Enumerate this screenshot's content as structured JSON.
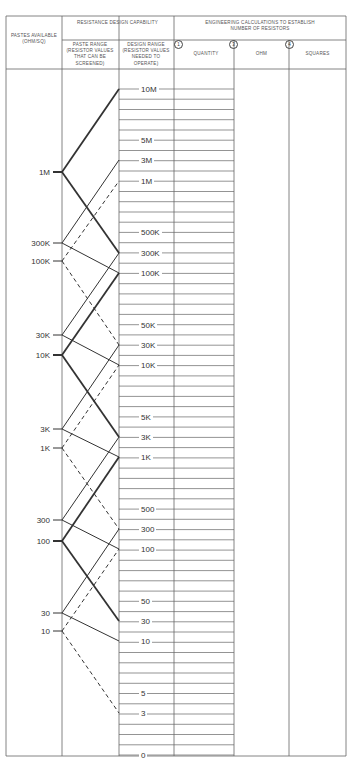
{
  "header": {
    "col_paste_available": "PASTES AVAILABLE (OHM/SQ)",
    "group_resistance": "RESISTANCE DESIGN CAPABILITY",
    "col_paste_range": "PASTE RANGE (RESISTOR VALUES THAT CAN BE SCREENED)",
    "col_design_range": "DESIGN RANGE (RESISTOR VALUES NEEDED TO OPERATE)",
    "group_engineering": "ENGINEERING CALCULATIONS TO ESTABLISH NUMBER OF RESISTORS",
    "col_quantity": {
      "num": "1",
      "label": "QUANTITY"
    },
    "col_ohm": {
      "num": "3",
      "label": "OHM"
    },
    "col_squares": {
      "num": "4",
      "label": "SQUARES"
    }
  },
  "pastes": [
    {
      "label": "1M",
      "y": 172,
      "style": "bold"
    },
    {
      "label": "300K",
      "y": 243,
      "style": "thin"
    },
    {
      "label": "100K",
      "y": 261,
      "style": "dashed"
    },
    {
      "label": "30K",
      "y": 335,
      "style": "thin"
    },
    {
      "label": "10K",
      "y": 355,
      "style": "bold"
    },
    {
      "label": "3K",
      "y": 429,
      "style": "thin"
    },
    {
      "label": "1K",
      "y": 448,
      "style": "dashed"
    },
    {
      "label": "300",
      "y": 520,
      "style": "thin"
    },
    {
      "label": "100",
      "y": 541,
      "style": "bold"
    },
    {
      "label": "30",
      "y": 613,
      "style": "thin"
    },
    {
      "label": "10",
      "y": 631,
      "style": "dashed"
    }
  ],
  "design_values": [
    {
      "label": "10M",
      "y": 89
    },
    {
      "label": "5M",
      "y": 140
    },
    {
      "label": "3M",
      "y": 160
    },
    {
      "label": "1M",
      "y": 181
    },
    {
      "label": "500K",
      "y": 232
    },
    {
      "label": "300K",
      "y": 253
    },
    {
      "label": "100K",
      "y": 273
    },
    {
      "label": "50K",
      "y": 325
    },
    {
      "label": "30K",
      "y": 345
    },
    {
      "label": "10K",
      "y": 365
    },
    {
      "label": "5K",
      "y": 417
    },
    {
      "label": "3K",
      "y": 437
    },
    {
      "label": "1K",
      "y": 457
    },
    {
      "label": "500",
      "y": 509
    },
    {
      "label": "300",
      "y": 529
    },
    {
      "label": "100",
      "y": 549
    },
    {
      "label": "50",
      "y": 601
    },
    {
      "label": "30",
      "y": 621
    },
    {
      "label": "10",
      "y": 641
    },
    {
      "label": "5",
      "y": 693
    },
    {
      "label": "3",
      "y": 713
    },
    {
      "label": "0",
      "y": 755
    }
  ],
  "connections": [
    {
      "from": "1M",
      "to": "10M",
      "style": "bold"
    },
    {
      "from": "1M",
      "to": "300K",
      "style": "bold"
    },
    {
      "from": "300K",
      "to": "3M",
      "style": "thin"
    },
    {
      "from": "300K",
      "to": "100K",
      "style": "thin"
    },
    {
      "from": "100K",
      "to": "1M",
      "style": "dashed"
    },
    {
      "from": "100K",
      "to": "30K",
      "style": "dashed"
    },
    {
      "from": "30K",
      "to": "300K",
      "style": "thin"
    },
    {
      "from": "30K",
      "to": "10K",
      "style": "thin"
    },
    {
      "from": "10K",
      "to": "100K",
      "style": "bold"
    },
    {
      "from": "10K",
      "to": "3K",
      "style": "bold"
    },
    {
      "from": "3K",
      "to": "30K",
      "style": "thin"
    },
    {
      "from": "3K",
      "to": "1K",
      "style": "thin"
    },
    {
      "from": "1K",
      "to": "10K",
      "style": "dashed"
    },
    {
      "from": "1K",
      "to": "300",
      "style": "dashed"
    },
    {
      "from": "300",
      "to": "3K",
      "style": "thin"
    },
    {
      "from": "300",
      "to": "100",
      "style": "thin"
    },
    {
      "from": "100",
      "to": "1K",
      "style": "bold"
    },
    {
      "from": "100",
      "to": "30",
      "style": "bold"
    },
    {
      "from": "30",
      "to": "300",
      "style": "thin"
    },
    {
      "from": "30",
      "to": "10",
      "style": "thin"
    },
    {
      "from": "10",
      "to": "100",
      "style": "dashed"
    },
    {
      "from": "10",
      "to": "3",
      "style": "dashed"
    }
  ],
  "colors": {
    "ink": "#333333",
    "rule": "#666666"
  }
}
